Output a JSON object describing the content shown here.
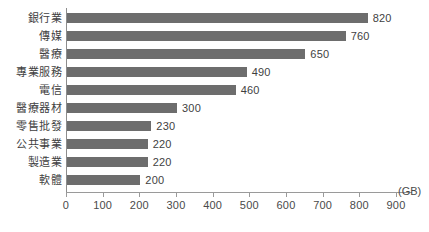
{
  "chart_data": {
    "type": "bar",
    "orientation": "horizontal",
    "title": "",
    "subtitle": "",
    "xlabel": "(GB)",
    "ylabel": "",
    "xlim": [
      0,
      900
    ],
    "grid": false,
    "legend": null,
    "xticks": [
      0,
      100,
      200,
      300,
      400,
      500,
      600,
      700,
      800,
      900
    ],
    "xtick_labels": [
      "0",
      "100",
      "200",
      "300",
      "400",
      "500",
      "600",
      "700",
      "800",
      "900"
    ],
    "categories": [
      "銀行業",
      "傳媒",
      "醫療",
      "專業服務",
      "電信",
      "醫療器材",
      "零售批發",
      "公共事業",
      "製造業",
      "軟體"
    ],
    "values": [
      820,
      760,
      650,
      490,
      460,
      300,
      230,
      220,
      220,
      200
    ],
    "value_labels": [
      "820",
      "760",
      "650",
      "490",
      "460",
      "300",
      "230",
      "220",
      "220",
      "200"
    ],
    "colors": {
      "bar": "#6d6d6d",
      "axis": "#9a9a9a",
      "text": "#3f3f3f",
      "background": "#ffffff"
    }
  },
  "unit": "(GB)"
}
